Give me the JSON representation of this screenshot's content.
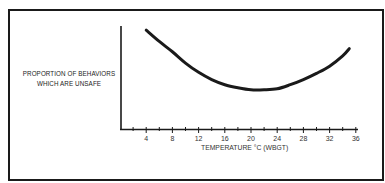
{
  "chart_data": {
    "type": "line",
    "title": "",
    "xlabel": "TEMPERATURE °C (WBGT)",
    "ylabel": "PROPORTION OF BEHAVIORS WHICH ARE UNSAFE",
    "ylabel_lines": [
      "PROPORTION OF BEHAVIORS",
      "WHICH ARE UNSAFE"
    ],
    "x_ticks": [
      4,
      8,
      12,
      16,
      20,
      24,
      28,
      32,
      36
    ],
    "x_minor_tick_step": 2,
    "xlim": [
      0,
      36
    ],
    "ylim": [
      0,
      1
    ],
    "y_ticks": [],
    "y_units_note": "relative (no numeric y scale shown)",
    "grid": false,
    "legend": null,
    "series": [
      {
        "name": "Unsafe behavior proportion",
        "x": [
          4,
          6,
          8,
          10,
          12,
          14,
          16,
          18,
          20,
          22,
          24,
          26,
          28,
          30,
          32,
          34,
          35
        ],
        "y": [
          0.96,
          0.85,
          0.75,
          0.64,
          0.55,
          0.48,
          0.43,
          0.4,
          0.38,
          0.38,
          0.39,
          0.43,
          0.48,
          0.54,
          0.61,
          0.71,
          0.78
        ]
      }
    ]
  },
  "labels": {
    "ylabel_line1": "PROPORTION OF BEHAVIORS",
    "ylabel_line2": "WHICH ARE UNSAFE",
    "xlabel": "TEMPERATURE °C (WBGT)"
  },
  "colors": {
    "line": "#1a1a1a",
    "axis": "#1a1a1a",
    "frame": "#1a1a1a",
    "background": "#ffffff"
  }
}
